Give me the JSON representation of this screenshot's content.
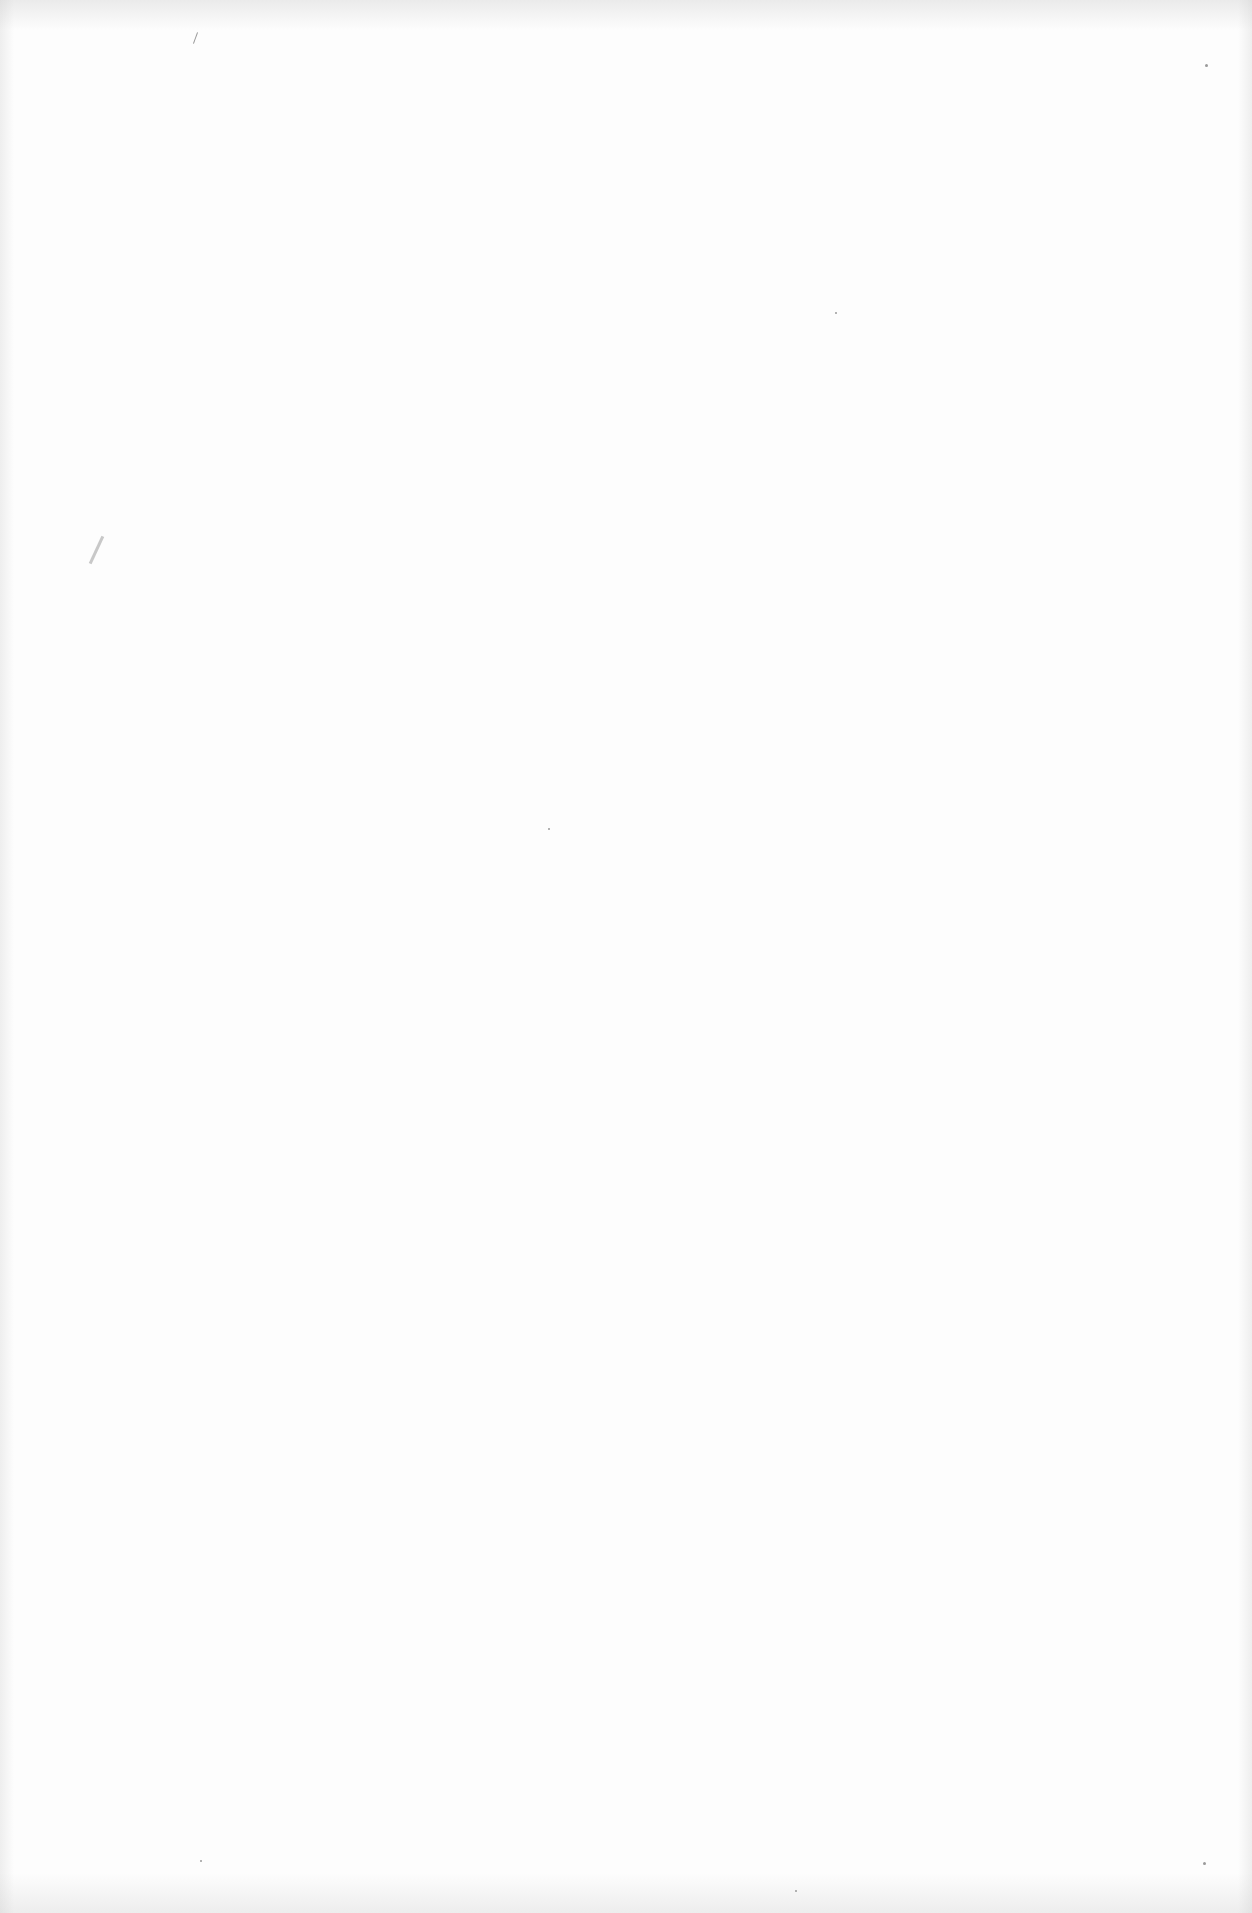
{
  "page": {
    "type": "blank scanned page",
    "background_color": "#fdfdfd"
  }
}
